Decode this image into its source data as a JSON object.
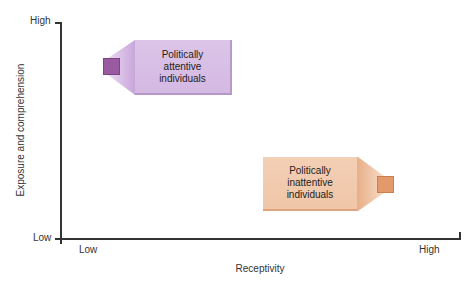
{
  "diagram": {
    "y_axis": {
      "title": "Exposure and comprehension",
      "high_label": "High",
      "low_label": "Low"
    },
    "x_axis": {
      "title": "Receptivity",
      "low_label": "Low",
      "high_label": "High"
    },
    "groups": [
      {
        "lines": [
          "Politically",
          "attentive",
          "individuals"
        ],
        "color": "#d8bfe6",
        "marker_color": "#9a5aa0",
        "position": "high exposure, low receptivity"
      },
      {
        "lines": [
          "Politically",
          "inattentive",
          "individuals"
        ],
        "color": "#f2cbb0",
        "marker_color": "#e39a6a",
        "position": "low exposure, high receptivity"
      }
    ]
  }
}
